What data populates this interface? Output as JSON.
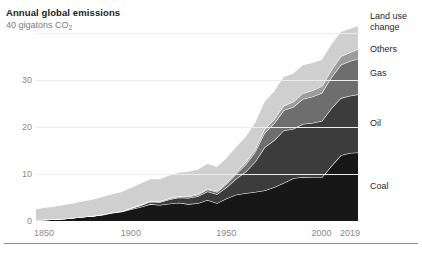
{
  "chart_data": {
    "type": "area",
    "stacked": true,
    "title": "Annual global emissions",
    "subtitle": "",
    "xlabel": "",
    "ylabel": "40 gigatons CO2",
    "y_axis_top_label": "40 gigatons CO",
    "y_axis_top_label_sub": "2",
    "ylim": [
      0,
      42
    ],
    "xlim": [
      1850,
      2019
    ],
    "yticks": [
      0,
      10,
      20,
      30,
      40
    ],
    "ytick_labels": [
      "0",
      "10",
      "20",
      "30",
      "40"
    ],
    "xticks": [
      1850,
      1900,
      1950,
      2000,
      2019
    ],
    "xtick_labels": [
      "1850",
      "1900",
      "1950",
      "2000",
      "2019"
    ],
    "grid": true,
    "grid_color": "#ededed",
    "legend_position": "right-inline",
    "units": "gigatons CO2 per year",
    "x": [
      1850,
      1855,
      1860,
      1865,
      1870,
      1875,
      1880,
      1885,
      1890,
      1895,
      1900,
      1905,
      1910,
      1915,
      1920,
      1925,
      1930,
      1935,
      1940,
      1945,
      1950,
      1955,
      1960,
      1965,
      1970,
      1975,
      1980,
      1985,
      1990,
      1995,
      2000,
      2005,
      2010,
      2015,
      2019
    ],
    "series": [
      {
        "name": "Coal",
        "color": "#171717",
        "values": [
          0.2,
          0.3,
          0.4,
          0.5,
          0.7,
          0.9,
          1.1,
          1.3,
          1.7,
          2.0,
          2.5,
          3.0,
          3.6,
          3.4,
          3.7,
          3.9,
          3.6,
          3.8,
          4.5,
          3.8,
          4.8,
          5.6,
          5.9,
          6.2,
          6.5,
          7.2,
          8.1,
          9.1,
          9.4,
          9.3,
          9.3,
          11.7,
          14.0,
          14.5,
          14.6
        ]
      },
      {
        "name": "Oil",
        "color": "#3c3c3c",
        "values": [
          0.0,
          0.0,
          0.0,
          0.0,
          0.0,
          0.0,
          0.0,
          0.1,
          0.1,
          0.1,
          0.2,
          0.3,
          0.5,
          0.6,
          0.9,
          1.1,
          1.3,
          1.5,
          1.8,
          1.9,
          2.4,
          3.4,
          4.6,
          6.4,
          9.2,
          10.0,
          11.2,
          10.5,
          11.3,
          11.6,
          12.0,
          12.3,
          12.2,
          12.2,
          12.4
        ]
      },
      {
        "name": "Gas",
        "color": "#6e6e6e",
        "values": [
          0.0,
          0.0,
          0.0,
          0.0,
          0.0,
          0.0,
          0.0,
          0.0,
          0.0,
          0.0,
          0.0,
          0.1,
          0.1,
          0.1,
          0.2,
          0.2,
          0.3,
          0.3,
          0.4,
          0.5,
          0.7,
          1.0,
          1.5,
          2.1,
          3.1,
          3.6,
          4.3,
          4.7,
          5.3,
          5.6,
          6.0,
          6.6,
          7.1,
          7.4,
          7.6
        ]
      },
      {
        "name": "Others",
        "color": "#9c9c9c",
        "values": [
          0.0,
          0.0,
          0.0,
          0.0,
          0.0,
          0.0,
          0.0,
          0.0,
          0.0,
          0.0,
          0.1,
          0.1,
          0.1,
          0.1,
          0.1,
          0.1,
          0.2,
          0.2,
          0.2,
          0.2,
          0.3,
          0.4,
          0.5,
          0.6,
          0.8,
          0.9,
          1.0,
          1.1,
          1.2,
          1.3,
          1.4,
          1.6,
          1.8,
          1.9,
          2.0
        ]
      },
      {
        "name": "Land use change",
        "color": "#cfcfcf",
        "values": [
          2.3,
          2.5,
          2.7,
          2.9,
          3.1,
          3.3,
          3.5,
          3.7,
          3.9,
          4.1,
          4.3,
          4.5,
          4.6,
          4.7,
          4.8,
          5.0,
          5.1,
          5.2,
          5.3,
          5.1,
          5.2,
          5.3,
          5.4,
          5.6,
          5.8,
          5.9,
          6.1,
          6.0,
          6.0,
          5.9,
          5.6,
          5.4,
          5.2,
          5.0,
          4.9
        ]
      }
    ],
    "separator_line_color": "#ffffff"
  },
  "legend": {
    "items": [
      {
        "label_line1": "Land use",
        "label_line2": "change"
      },
      {
        "label": "Others"
      },
      {
        "label": "Gas"
      },
      {
        "label": "Oil"
      },
      {
        "label": "Coal"
      }
    ]
  }
}
